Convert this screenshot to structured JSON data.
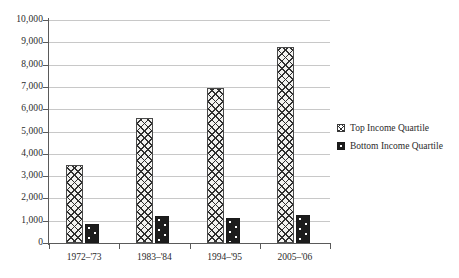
{
  "chart_data": {
    "type": "bar",
    "title": "",
    "subtitle": "",
    "xlabel": "",
    "ylabel": "",
    "categories": [
      "1972–'73",
      "1983–'84",
      "1994–'95",
      "2005–'06"
    ],
    "series": [
      {
        "name": "Top Income Quartile",
        "pattern": "diagonal-crosshatch",
        "values": [
          3520,
          5620,
          6950,
          8800
        ]
      },
      {
        "name": "Bottom Income Quartile",
        "pattern": "dark-dotted",
        "values": [
          870,
          1230,
          1130,
          1240
        ]
      }
    ],
    "ylim": [
      0,
      10000
    ],
    "ytick_step": 1000,
    "ytick_labels": [
      "0",
      "1,000",
      "2,000",
      "3,000",
      "4,000",
      "5,000",
      "6,000",
      "7,000",
      "8,000",
      "9,000",
      "10,000"
    ],
    "ytick_values": [
      0,
      1000,
      2000,
      3000,
      4000,
      5000,
      6000,
      7000,
      8000,
      9000,
      10000
    ],
    "grid": true,
    "grid_axis": "y",
    "legend_position": "right",
    "legend": [
      "Top Income Quartile",
      "Bottom Income Quartile"
    ],
    "colors": {
      "gridline": "#c8c8c8",
      "axis": "#5a5a5a",
      "text": "#2b2b2b",
      "top_quartile_fill": "#f2f2f0",
      "top_quartile_stroke": "#4a4a4a",
      "bottom_quartile_fill": "#1c1c1c",
      "bottom_quartile_dot": "#ffffff",
      "background": "#ffffff"
    }
  }
}
